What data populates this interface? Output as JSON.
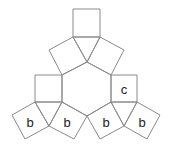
{
  "diagram": {
    "stroke_color": "#8a8a8a",
    "labels": {
      "c": "c",
      "b1": "b",
      "b2": "b",
      "b3": "b",
      "b4": "b"
    }
  }
}
